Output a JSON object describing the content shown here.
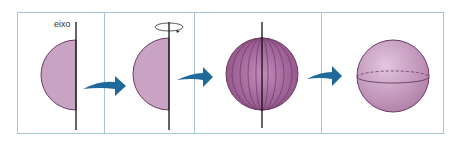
{
  "diagram": {
    "axis_label": "eixo",
    "panels": [
      {
        "id": 1,
        "content": "semicircle with vertical axis"
      },
      {
        "id": 2,
        "content": "semicircle rotating around axis"
      },
      {
        "id": 3,
        "content": "sphere with meridians from rotation"
      },
      {
        "id": 4,
        "content": "resulting sphere with equator"
      }
    ],
    "arrows": 3,
    "colors": {
      "shape_fill": "#c9a3c4",
      "shape_stroke": "#6b3a63",
      "sphere_dark": "#8e4f86",
      "arrow": "#1f6a9a",
      "border": "#a9c3d6"
    }
  }
}
